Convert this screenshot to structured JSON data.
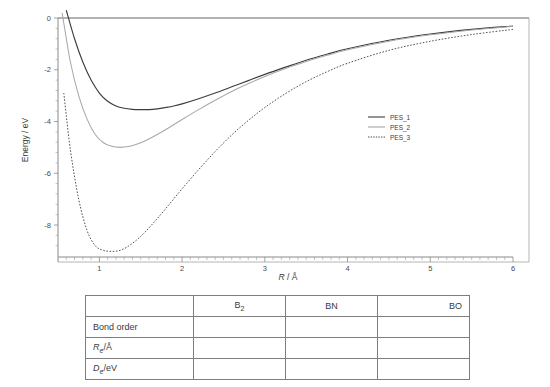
{
  "chart_data": {
    "type": "line",
    "title": "",
    "xlabel": "R / Å",
    "ylabel": "Energy / eV",
    "xlim": [
      0.5,
      6.0
    ],
    "ylim": [
      -9.6,
      0.3
    ],
    "xticks": [
      1,
      2,
      3,
      4,
      5,
      6
    ],
    "xticklabels": [
      "1",
      "2",
      "3",
      "4",
      "5",
      "6"
    ],
    "yticks": [
      0,
      -2,
      -4,
      -6,
      -8
    ],
    "yticklabels": [
      "0",
      "-2",
      "-4",
      "-6",
      "-8"
    ],
    "grid": false,
    "legend_position": "center-right",
    "series": [
      {
        "name": "PES_1",
        "style": "solid",
        "color": "#3d3d3d",
        "r_min": 1.6,
        "e_min": -3.5,
        "x": [
          0.6,
          0.7,
          0.8,
          0.9,
          1.0,
          1.1,
          1.2,
          1.3,
          1.4,
          1.5,
          1.6,
          1.7,
          1.8,
          1.9,
          2.0,
          2.2,
          2.4,
          2.6,
          2.8,
          3.0,
          3.25,
          3.5,
          3.75,
          4.0,
          4.5,
          5.0,
          5.5,
          6.0
        ],
        "y": [
          0.3,
          -0.8,
          -1.7,
          -2.4,
          -2.9,
          -3.22,
          -3.4,
          -3.49,
          -3.53,
          -3.54,
          -3.54,
          -3.51,
          -3.46,
          -3.4,
          -3.32,
          -3.12,
          -2.9,
          -2.66,
          -2.42,
          -2.18,
          -1.9,
          -1.63,
          -1.4,
          -1.19,
          -0.86,
          -0.62,
          -0.44,
          -0.31
        ]
      },
      {
        "name": "PES_2",
        "style": "solid",
        "color": "#a8a8a8",
        "r_min": 1.3,
        "e_min": -5.0,
        "x": [
          0.55,
          0.65,
          0.75,
          0.85,
          0.95,
          1.05,
          1.15,
          1.25,
          1.35,
          1.45,
          1.55,
          1.7,
          1.85,
          2.0,
          2.2,
          2.4,
          2.6,
          2.8,
          3.0,
          3.25,
          3.5,
          3.75,
          4.0,
          4.5,
          5.0,
          5.5,
          6.0
        ],
        "y": [
          0.2,
          -1.7,
          -3.0,
          -3.9,
          -4.5,
          -4.82,
          -4.96,
          -5.0,
          -4.97,
          -4.88,
          -4.75,
          -4.5,
          -4.22,
          -3.92,
          -3.54,
          -3.18,
          -2.84,
          -2.54,
          -2.26,
          -1.95,
          -1.68,
          -1.44,
          -1.23,
          -0.9,
          -0.65,
          -0.46,
          -0.32
        ]
      },
      {
        "name": "PES_3",
        "style": "dotted",
        "color": "#4a4a4a",
        "r_min": 1.2,
        "e_min": -9.0,
        "x": [
          0.57,
          0.65,
          0.75,
          0.85,
          0.95,
          1.05,
          1.15,
          1.25,
          1.35,
          1.45,
          1.55,
          1.7,
          1.85,
          2.0,
          2.2,
          2.4,
          2.6,
          2.8,
          3.0,
          3.25,
          3.5,
          3.75,
          4.0,
          4.5,
          5.0,
          5.5,
          6.0
        ],
        "y": [
          -2.9,
          -5.1,
          -7.0,
          -8.2,
          -8.8,
          -8.98,
          -9.02,
          -8.98,
          -8.82,
          -8.58,
          -8.28,
          -7.75,
          -7.18,
          -6.6,
          -5.86,
          -5.16,
          -4.52,
          -3.96,
          -3.46,
          -2.92,
          -2.46,
          -2.08,
          -1.75,
          -1.25,
          -0.9,
          -0.64,
          -0.44
        ]
      }
    ]
  },
  "chart": {
    "ylabel": "Energy / eV",
    "xlabel_italic": "R",
    "xlabel_rest": " / Å",
    "legend": [
      {
        "label": "PES_1"
      },
      {
        "label": "PES_2"
      },
      {
        "label": "PES_3"
      }
    ]
  },
  "table": {
    "corner_label": "",
    "columns": [
      {
        "label": "B",
        "sub": "2",
        "align": "center"
      },
      {
        "label": "BN",
        "sub": "",
        "align": "center"
      },
      {
        "label": "BO",
        "sub": "",
        "align": "right"
      }
    ],
    "rows": [
      {
        "label": "Bond order",
        "italic": "",
        "sub": "",
        "rest": "",
        "cells": [
          "",
          "",
          ""
        ]
      },
      {
        "label": "",
        "italic": "R",
        "sub": "e",
        "rest": "/Å",
        "cells": [
          "",
          "",
          ""
        ]
      },
      {
        "label": "",
        "italic": "D",
        "sub": "e",
        "rest": "/eV",
        "cells": [
          "",
          "",
          ""
        ]
      }
    ]
  }
}
